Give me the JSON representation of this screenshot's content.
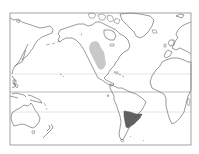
{
  "map": {
    "projection": "world map, Pacific-centered",
    "frame": {
      "x": 10,
      "y": 13,
      "width": 181,
      "height": 132,
      "color": "#8a8a8a"
    },
    "reference_lines": [
      {
        "name": "tropic-of-cancer",
        "y": 74,
        "color": "#d4d4d4"
      },
      {
        "name": "equator",
        "y": 92,
        "color": "#a8a8a8"
      },
      {
        "name": "tropic-of-capricorn",
        "y": 112,
        "color": "#d4d4d4"
      }
    ],
    "regions": [
      {
        "name": "north-america-range",
        "label": "Western interior North America",
        "color": "#c8c8c8"
      },
      {
        "name": "south-america-range",
        "label": "Southern South America (Pampas / Patagonia)",
        "color": "#606060"
      }
    ],
    "land_stroke": "#555555",
    "ocean_color": "#ffffff"
  }
}
